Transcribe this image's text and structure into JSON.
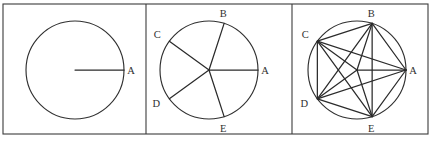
{
  "figure": {
    "background_color": "#ffffff",
    "stroke_color": "#2b2b2b",
    "frame_color": "#3b3b3b",
    "panel_count": 3,
    "frame": {
      "x": 3,
      "y": 4,
      "width": 425,
      "height": 130
    },
    "dividers": [
      146,
      292
    ],
    "panels": [
      {
        "id": "panel-1",
        "caption": "",
        "circle": {
          "cx": 75,
          "cy": 70,
          "r": 49
        },
        "points": [
          {
            "label": "A",
            "angle_deg": 0,
            "label_dx": 7,
            "label_dy": 4
          }
        ],
        "radii": [
          "A"
        ],
        "chords": []
      },
      {
        "id": "panel-2",
        "caption": "",
        "circle": {
          "cx": 209,
          "cy": 70,
          "r": 49
        },
        "points": [
          {
            "label": "A",
            "angle_deg": 0,
            "label_dx": 7,
            "label_dy": 4
          },
          {
            "label": "B",
            "angle_deg": 72,
            "label_dx": -1,
            "label_dy": -6
          },
          {
            "label": "C",
            "angle_deg": 144,
            "label_dx": -12,
            "label_dy": -3
          },
          {
            "label": "D",
            "angle_deg": 216,
            "label_dx": -13,
            "label_dy": 8
          },
          {
            "label": "E",
            "angle_deg": 288,
            "label_dx": -1,
            "label_dy": 15
          }
        ],
        "radii": [
          "A",
          "B",
          "C",
          "D",
          "E"
        ],
        "chords": []
      },
      {
        "id": "panel-3",
        "caption": "",
        "circle": {
          "cx": 357,
          "cy": 70,
          "r": 49
        },
        "points": [
          {
            "label": "A",
            "angle_deg": 0,
            "label_dx": 7,
            "label_dy": 4
          },
          {
            "label": "B",
            "angle_deg": 72,
            "label_dx": -1,
            "label_dy": -6
          },
          {
            "label": "C",
            "angle_deg": 144,
            "label_dx": -12,
            "label_dy": -3
          },
          {
            "label": "D",
            "angle_deg": 216,
            "label_dx": -13,
            "label_dy": 8
          },
          {
            "label": "E",
            "angle_deg": 288,
            "label_dx": -1,
            "label_dy": 15
          }
        ],
        "radii": [
          "A",
          "B",
          "C",
          "D",
          "E"
        ],
        "chords": [
          [
            "A",
            "B"
          ],
          [
            "B",
            "C"
          ],
          [
            "C",
            "D"
          ],
          [
            "D",
            "E"
          ],
          [
            "E",
            "A"
          ],
          [
            "A",
            "C"
          ],
          [
            "A",
            "D"
          ],
          [
            "B",
            "D"
          ],
          [
            "B",
            "E"
          ],
          [
            "C",
            "E"
          ]
        ]
      }
    ]
  },
  "labels": {
    "A": "A",
    "B": "B",
    "C": "C",
    "D": "D",
    "E": "E"
  }
}
